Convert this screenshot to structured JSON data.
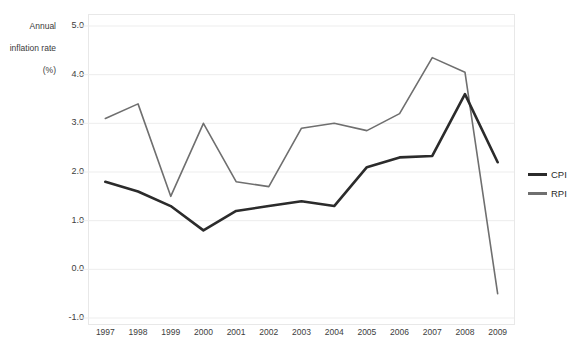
{
  "chart_data": {
    "type": "line",
    "title": "Annual inflation rate (%)",
    "title_lines": [
      "Annual",
      "inflation rate",
      "(%)"
    ],
    "xlabel": "",
    "ylabel": "Annual inflation rate (%)",
    "categories": [
      "1997",
      "1998",
      "1999",
      "2000",
      "2001",
      "2002",
      "2003",
      "2004",
      "2005",
      "2006",
      "2007",
      "2008",
      "2009"
    ],
    "ylim": [
      -1.0,
      5.0
    ],
    "ytick_labels": [
      "5.0",
      "4.0",
      "3.0",
      "2.0",
      "1.0",
      "0.0",
      "-1.0"
    ],
    "ytick_values": [
      5.0,
      4.0,
      3.0,
      2.0,
      1.0,
      0.0,
      -1.0
    ],
    "grid": true,
    "grid_axis": "y",
    "legend_position": "right",
    "series": [
      {
        "name": "CPI",
        "color": "#2b2b2b",
        "values": [
          1.8,
          1.6,
          1.3,
          0.8,
          1.2,
          1.3,
          1.4,
          1.3,
          2.1,
          2.3,
          2.33,
          3.6,
          2.2
        ]
      },
      {
        "name": "RPI",
        "color": "#6f6f6f",
        "values": [
          3.1,
          3.4,
          1.5,
          3.0,
          1.8,
          1.7,
          2.9,
          3.0,
          2.85,
          3.2,
          4.35,
          4.05,
          -0.5
        ]
      }
    ]
  },
  "colors": {
    "grid": "#ededed",
    "frame": "#e8e8e8",
    "text": "#3d3d3d",
    "background": "#ffffff"
  }
}
